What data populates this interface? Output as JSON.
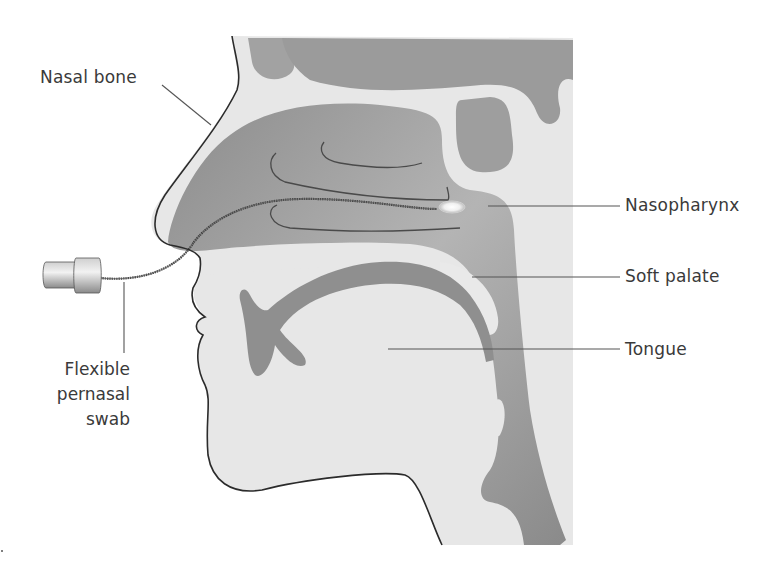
{
  "figure": {
    "labels": {
      "nasal_bone": "Nasal bone",
      "nasopharynx": "Nasopharynx",
      "soft_palate": "Soft palate",
      "tongue": "Tongue",
      "swab": [
        "Flexible",
        "pernasal",
        "swab"
      ]
    },
    "colors": {
      "background": "#ffffff",
      "tissue_light": "#e6e6e6",
      "cavity_dark": "#8e8e8e",
      "cavity_mid": "#a9a9a9",
      "outline": "#2b2b2b",
      "leader_line": "#555555",
      "text": "#3a3a3a",
      "swab_tip": "#f4f4f4"
    }
  }
}
